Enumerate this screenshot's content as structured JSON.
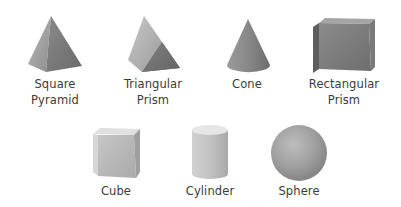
{
  "shapes": [
    {
      "id": "square-pyramid",
      "label": "Square\nPyramid"
    },
    {
      "id": "triangular-prism",
      "label": "Triangular\nPrism"
    },
    {
      "id": "cone",
      "label": "Cone"
    },
    {
      "id": "rectangular-prism",
      "label": "Rectangular\nPrism"
    },
    {
      "id": "cube",
      "label": "Cube"
    },
    {
      "id": "cylinder",
      "label": "Cylinder"
    },
    {
      "id": "sphere",
      "label": "Sphere"
    }
  ],
  "colors": {
    "background": "#ffffff",
    "label_text": "#3b3b3b",
    "shape_light": "#c8c8c8",
    "shape_mid": "#9a9a9a",
    "shape_dark": "#6e6e6e"
  }
}
